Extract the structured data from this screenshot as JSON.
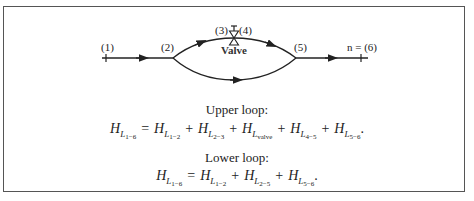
{
  "diagram": {
    "points": [
      {
        "id": "p1",
        "label": "(1)"
      },
      {
        "id": "p2",
        "label": "(2)"
      },
      {
        "id": "p3",
        "label": "(3)"
      },
      {
        "id": "p4",
        "label": "(4)"
      },
      {
        "id": "p5",
        "label": "(5)"
      },
      {
        "id": "p6",
        "label": "n = (6)"
      }
    ],
    "valve_label": "Valve"
  },
  "upper_loop": {
    "heading": "Upper loop:",
    "lhs": {
      "base": "H",
      "sub": "L",
      "subsub": "1−6"
    },
    "equals": "=",
    "terms": [
      {
        "base": "H",
        "sub": "L",
        "subsub": "1−2"
      },
      {
        "base": "H",
        "sub": "L",
        "subsub": "2−3"
      },
      {
        "base": "H",
        "sub": "L",
        "subsub": "valve"
      },
      {
        "base": "H",
        "sub": "L",
        "subsub": "4−5"
      },
      {
        "base": "H",
        "sub": "L",
        "subsub": "5−6"
      }
    ],
    "plus": "+",
    "end": "."
  },
  "lower_loop": {
    "heading": "Lower loop:",
    "lhs": {
      "base": "H",
      "sub": "L",
      "subsub": "1−6"
    },
    "equals": "=",
    "terms": [
      {
        "base": "H",
        "sub": "L",
        "subsub": "1−2"
      },
      {
        "base": "H",
        "sub": "L",
        "subsub": "2−5"
      },
      {
        "base": "H",
        "sub": "L",
        "subsub": "5−6"
      }
    ],
    "plus": "+",
    "end": "."
  }
}
